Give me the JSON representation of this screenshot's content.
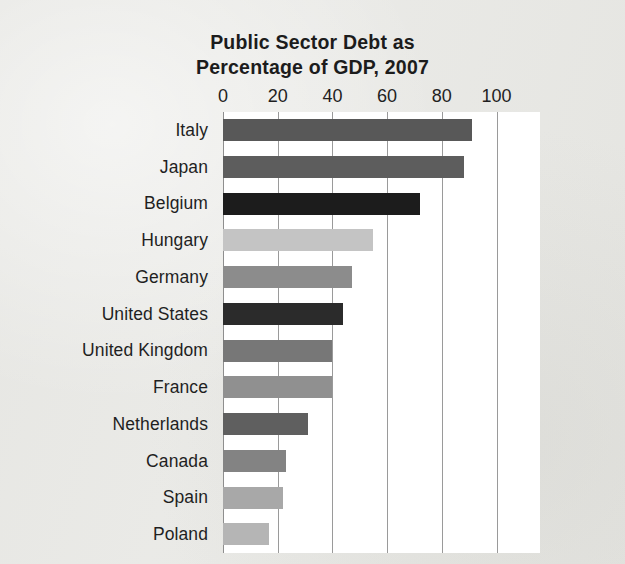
{
  "chart_data": {
    "type": "bar",
    "orientation": "horizontal",
    "title": "Public Sector Debt as Percentage of GDP, 2007",
    "title_lines": [
      "Public Sector Debt as",
      "Percentage of GDP, 2007"
    ],
    "xlabel": "",
    "ylabel": "",
    "xlim": [
      0,
      100
    ],
    "xticks": [
      0,
      20,
      40,
      60,
      80,
      100
    ],
    "xtick_labels": [
      "0",
      "20",
      "40",
      "60",
      "80",
      "100"
    ],
    "grid": true,
    "grid_axis": "x",
    "legend": false,
    "categories": [
      "Italy",
      "Japan",
      "Belgium",
      "Hungary",
      "Germany",
      "United States",
      "United Kingdom",
      "France",
      "Netherlands",
      "Canada",
      "Spain",
      "Poland"
    ],
    "values": [
      91,
      88,
      72,
      55,
      47,
      44,
      40,
      40,
      31,
      23,
      22,
      17
    ],
    "bar_colors": [
      "#585858",
      "#5d5d5d",
      "#1c1c1c",
      "#c4c4c4",
      "#8c8c8c",
      "#2b2b2b",
      "#777777",
      "#909090",
      "#5f5f5f",
      "#838383",
      "#a8a8a8",
      "#b5b5b5"
    ]
  },
  "style": {
    "page_background": "#e9e9e6",
    "plot_background": "#ffffff",
    "gridline_color": "#9a9a9a",
    "text_color": "#1f1f1f"
  }
}
